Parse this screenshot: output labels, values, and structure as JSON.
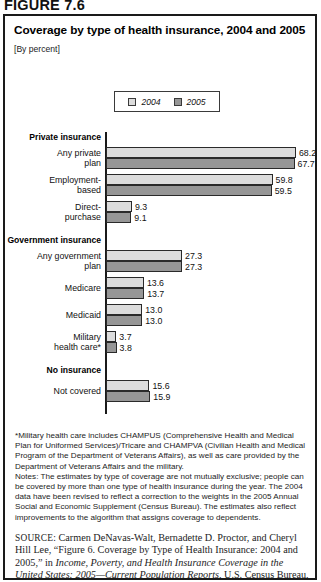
{
  "figure": {
    "label": "FIGURE 7.6",
    "title": "Coverage by type of health insurance, 2004 and 2005",
    "subtitle": "[By percent]"
  },
  "legend": {
    "items": [
      {
        "label": "2004",
        "color": "#dcdcdc",
        "icon": "square-swatch-light"
      },
      {
        "label": "2005",
        "color": "#969696",
        "icon": "square-swatch-dark"
      }
    ]
  },
  "chart_data": {
    "type": "bar",
    "orientation": "horizontal",
    "title": "Coverage by type of health insurance, 2004 and 2005",
    "subtitle": "[By percent]",
    "xlabel": "",
    "ylabel": "",
    "xlim": [
      0,
      70
    ],
    "grid": false,
    "legend_position": "top-center",
    "categories": [
      "Any private plan",
      "Employment-based",
      "Direct-purchase",
      "Any government plan",
      "Medicare",
      "Medicaid",
      "Military health care*",
      "Not covered"
    ],
    "groups": [
      {
        "heading": "Private insurance",
        "categories": [
          "Any private plan",
          "Employment-based",
          "Direct-purchase"
        ]
      },
      {
        "heading": "Government insurance",
        "categories": [
          "Any government plan",
          "Medicare",
          "Medicaid",
          "Military health care*"
        ]
      },
      {
        "heading": "No insurance",
        "categories": [
          "Not covered"
        ]
      }
    ],
    "series": [
      {
        "name": "2004",
        "color": "#dcdcdc",
        "values": [
          68.2,
          59.8,
          9.3,
          27.3,
          13.6,
          13.0,
          3.7,
          15.6
        ]
      },
      {
        "name": "2005",
        "color": "#969696",
        "values": [
          67.7,
          59.5,
          9.1,
          27.3,
          13.7,
          13.0,
          3.8,
          15.9
        ]
      }
    ],
    "value_labels": {
      "2004": [
        "68.2",
        "59.8",
        "9.3",
        "27.3",
        "13.6",
        "13.0",
        "3.7",
        "15.6"
      ],
      "2005": [
        "67.7",
        "59.5",
        "9.1",
        "27.3",
        "13.7",
        "13.0",
        "3.8",
        "15.9"
      ]
    }
  },
  "rows": [
    {
      "kind": "heading",
      "text": "Private insurance"
    },
    {
      "kind": "bars",
      "label": "Any private\nplan",
      "v2004": 68.2,
      "v2005": 67.7,
      "t2004": "68.2",
      "t2005": "67.7"
    },
    {
      "kind": "bars",
      "label": "Employment-\nbased",
      "v2004": 59.8,
      "v2005": 59.5,
      "t2004": "59.8",
      "t2005": "59.5"
    },
    {
      "kind": "bars",
      "label": "Direct-\npurchase",
      "v2004": 9.3,
      "v2005": 9.1,
      "t2004": "9.3",
      "t2005": "9.1"
    },
    {
      "kind": "heading",
      "text": "Government insurance"
    },
    {
      "kind": "bars",
      "label": "Any government\nplan",
      "v2004": 27.3,
      "v2005": 27.3,
      "t2004": "27.3",
      "t2005": "27.3"
    },
    {
      "kind": "bars",
      "label": "Medicare",
      "v2004": 13.6,
      "v2005": 13.7,
      "t2004": "13.6",
      "t2005": "13.7"
    },
    {
      "kind": "bars",
      "label": "Medicaid",
      "v2004": 13.0,
      "v2005": 13.0,
      "t2004": "13.0",
      "t2005": "13.0"
    },
    {
      "kind": "bars",
      "label": "Military\nhealth care*",
      "v2004": 3.7,
      "v2005": 3.8,
      "t2004": "3.7",
      "t2005": "3.8"
    },
    {
      "kind": "heading",
      "text": "No insurance"
    },
    {
      "kind": "bars",
      "label": "Not covered",
      "v2004": 15.6,
      "v2005": 15.9,
      "t2004": "15.6",
      "t2005": "15.9"
    }
  ],
  "notes": {
    "footnote": "*Military health care includes CHAMPUS (Comprehensive Health and Medical Plan for Uniformed Services)/Tricare and CHAMPVA (Civilian Health and Medical Program of the Department of Veterans Affairs), as well as care provided by the Department of Veterans Affairs and the military.",
    "general": "Notes: The estimates by type of coverage are not mutually exclusive; people can be covered by more than one type of health insurance during the year. The 2004 data have been revised to reflect a correction to the weights in the 2005 Annual Social and Economic Supplement (Census Bureau). The estimates also reflect improvements to the algorithm that assigns coverage to dependents."
  },
  "source": {
    "prefix": "SOURCE:",
    "line1": " Carmen DeNavas-Walt, Bernadette D. Proctor, and Cheryl Hill Lee, “Figure 6. Coverage by Type of Health Insurance: 2004 and 2005,” in ",
    "italic1": "Income, Poverty, and Health Insurance Coverage in the United States: 2005—Current Population Reports",
    "tail": ", U.S. Census Bureau,"
  }
}
